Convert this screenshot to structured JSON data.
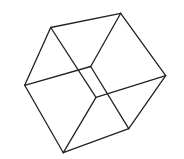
{
  "diagram": {
    "title": "",
    "background": "#ffffff",
    "stroke_color": "#222222",
    "stroke_width": 1.3,
    "vertices": {
      "A": [
        50.7,
        27.5
      ],
      "B": [
        120.7,
        13.3
      ],
      "C": [
        165.7,
        75.7
      ],
      "D": [
        128.7,
        128.7
      ],
      "E": [
        63.3,
        152.7
      ],
      "F": [
        24.7,
        85.3
      ],
      "G": [
        90.7,
        66.5
      ],
      "H": [
        96.0,
        97.3
      ]
    },
    "edges": [
      [
        "A",
        "B"
      ],
      [
        "B",
        "C"
      ],
      [
        "C",
        "D"
      ],
      [
        "D",
        "E"
      ],
      [
        "E",
        "F"
      ],
      [
        "F",
        "A"
      ],
      [
        "A",
        "H"
      ],
      [
        "H",
        "E"
      ],
      [
        "H",
        "C"
      ],
      [
        "G",
        "B"
      ],
      [
        "G",
        "F"
      ],
      [
        "G",
        "D"
      ]
    ]
  }
}
